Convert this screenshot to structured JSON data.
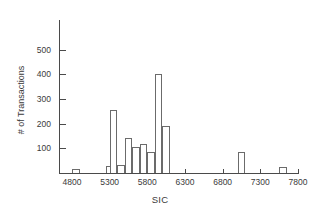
{
  "chart_data": {
    "type": "bar",
    "title": "",
    "subtitle": "",
    "xlabel": "SIC",
    "ylabel": "# of Transactions",
    "xlim": [
      4650,
      7800
    ],
    "ylim": [
      0,
      560
    ],
    "grid": false,
    "legend": null,
    "bin_width": 100,
    "xticks": [
      4800,
      5300,
      5800,
      6300,
      6800,
      7300,
      7800
    ],
    "xtick_labels": [
      "4800",
      "5300",
      "5800",
      "6300",
      "6800",
      "7300",
      "7800"
    ],
    "yticks": [
      100,
      200,
      300,
      400,
      500
    ],
    "ytick_labels": [
      "100",
      "200",
      "300",
      "400",
      "500"
    ],
    "bins": [
      {
        "start": 4800,
        "end": 4900,
        "value": 18
      },
      {
        "start": 5250,
        "end": 5350,
        "value": 30
      },
      {
        "start": 5300,
        "end": 5400,
        "value": 255
      },
      {
        "start": 5400,
        "end": 5500,
        "value": 33
      },
      {
        "start": 5500,
        "end": 5600,
        "value": 140
      },
      {
        "start": 5600,
        "end": 5700,
        "value": 107
      },
      {
        "start": 5700,
        "end": 5800,
        "value": 118
      },
      {
        "start": 5800,
        "end": 5900,
        "value": 85
      },
      {
        "start": 5900,
        "end": 6000,
        "value": 400
      },
      {
        "start": 6000,
        "end": 6100,
        "value": 190
      },
      {
        "start": 7000,
        "end": 7100,
        "value": 83
      },
      {
        "start": 7550,
        "end": 7650,
        "value": 25
      }
    ],
    "colors": {
      "bar_stroke": "#6b6b6b",
      "bar_fill": "#ffffff",
      "axis": "#4a4a4a",
      "text": "#3a3a3a",
      "background": "#ffffff"
    }
  }
}
